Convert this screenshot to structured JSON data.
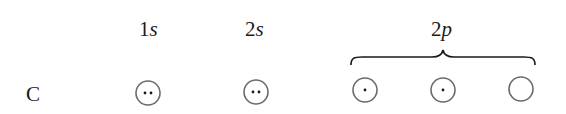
{
  "element": {
    "symbol": "C"
  },
  "orbitals": [
    {
      "label_num": "1",
      "label_sub": "s",
      "electrons": 2
    },
    {
      "label_num": "2",
      "label_sub": "s",
      "electrons": 2
    },
    {
      "label_num": "2",
      "label_sub": "p",
      "boxes": [
        1,
        1,
        0
      ]
    }
  ],
  "colors": {
    "ink": "#1a1a1a",
    "circle": "#6b6b6b"
  }
}
